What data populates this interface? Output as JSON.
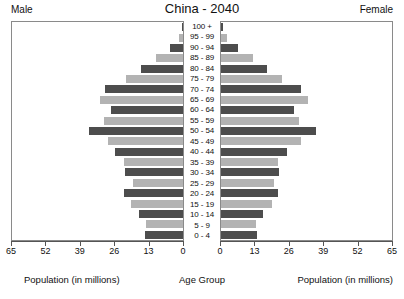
{
  "header": {
    "title": "China - 2040",
    "male_label": "Male",
    "female_label": "Female"
  },
  "footer": {
    "male_caption": "Population (in millions)",
    "center_caption": "Age Group",
    "female_caption": "Population (in millions)"
  },
  "colors": {
    "bar_dark": "#4d4d4d",
    "bar_light": "#b3b3b3",
    "frame": "#8a8a8a",
    "axis": "#555555",
    "text": "#111111",
    "background": "#ffffff"
  },
  "chart_data": {
    "type": "bar",
    "subtype": "population-pyramid",
    "title": "China - 2040",
    "xlabel": "Population (in millions)",
    "ylabel": "Age Group",
    "grid": false,
    "legend_position": "none",
    "axis_ticks": [
      0,
      13,
      26,
      39,
      52,
      65
    ],
    "left_axis_ticks": [
      65,
      52,
      39,
      26,
      13,
      0
    ],
    "right_axis_ticks": [
      0,
      13,
      26,
      39,
      52,
      65
    ],
    "xlim": [
      0,
      65
    ],
    "categories": [
      "100 +",
      "95 - 99",
      "90 - 94",
      "85 - 89",
      "80 - 84",
      "75 - 79",
      "70 - 74",
      "65 - 69",
      "60 - 64",
      "55 - 59",
      "50 - 54",
      "45 - 49",
      "40 - 44",
      "35 - 39",
      "30 - 34",
      "25 - 29",
      "20 - 24",
      "15 - 19",
      "10 - 14",
      "5 - 9",
      "0 - 4"
    ],
    "series": [
      {
        "name": "Male",
        "side": "left",
        "color": "#4d4d4d",
        "values": [
          0.4,
          1.6,
          5.0,
          10.4,
          16.0,
          21.6,
          29.6,
          31.6,
          27.2,
          30.0,
          35.6,
          28.4,
          26.0,
          22.4,
          22.0,
          19.2,
          22.4,
          19.6,
          16.8,
          14.0,
          14.4
        ]
      },
      {
        "name": "Female",
        "side": "right",
        "color": "#b3b3b3",
        "values": [
          0.6,
          2.2,
          6.4,
          12.0,
          17.6,
          23.2,
          30.4,
          33.2,
          27.6,
          29.6,
          36.0,
          30.4,
          25.2,
          21.6,
          22.0,
          20.0,
          21.6,
          19.2,
          16.0,
          13.2,
          13.6
        ]
      }
    ]
  }
}
